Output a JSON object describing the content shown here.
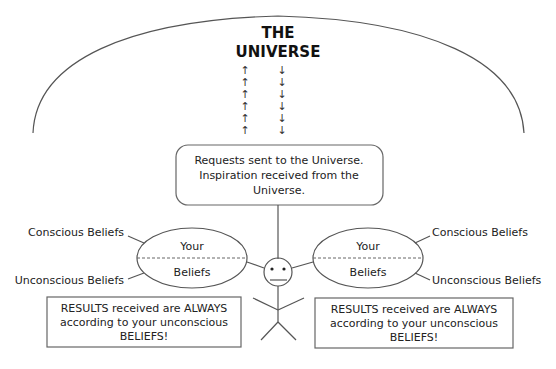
{
  "diagram": {
    "title_line1": "THE",
    "title_line2": "UNIVERSE",
    "arrows": {
      "up_icon": "↑",
      "down_icon": "↓",
      "count": 6
    },
    "center_box": {
      "line1": "Requests sent to the Universe.",
      "line2": "Inspiration received from the",
      "line3": "Universe."
    },
    "left_beliefs": {
      "top": "Your",
      "bottom": "Beliefs",
      "conscious_label": "Conscious Beliefs",
      "unconscious_label": "Unconscious Beliefs"
    },
    "right_beliefs": {
      "top": "Your",
      "bottom": "Beliefs",
      "conscious_label": "Conscious Beliefs",
      "unconscious_label": "Unconscious Beliefs"
    },
    "left_results": {
      "line1": "RESULTS received are ALWAYS",
      "line2": "according to your unconscious",
      "line3": "BELIEFS!"
    },
    "right_results": {
      "line1": "RESULTS received are ALWAYS",
      "line2": "according to your unconscious",
      "line3": "BELIEFS!"
    },
    "colors": {
      "line": "#555555",
      "text": "#222222",
      "background": "#ffffff"
    }
  }
}
